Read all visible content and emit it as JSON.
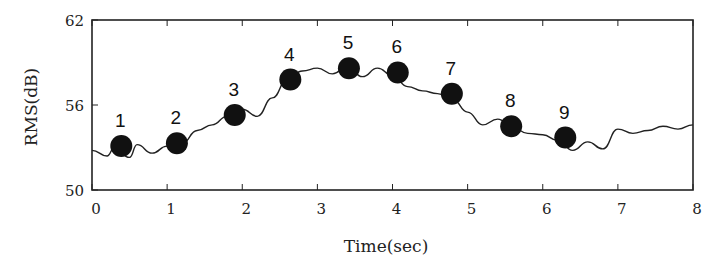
{
  "chart_data": {
    "type": "line",
    "title": "",
    "xlabel": "Time(sec)",
    "ylabel": "RMS(dB)",
    "xlim": [
      0,
      8
    ],
    "ylim": [
      50,
      62
    ],
    "x_ticks": [
      "0",
      "1",
      "2",
      "3",
      "4",
      "5",
      "6",
      "7",
      "8"
    ],
    "y_ticks": [
      "50",
      "56",
      "62"
    ],
    "grid": false,
    "legend": null,
    "series": [
      {
        "name": "RMS",
        "x": [
          0,
          0.2,
          0.3,
          0.5,
          0.6,
          0.8,
          1.0,
          1.2,
          1.4,
          1.6,
          1.8,
          2.0,
          2.2,
          2.4,
          2.6,
          2.8,
          3.0,
          3.2,
          3.4,
          3.6,
          3.8,
          4.0,
          4.2,
          4.4,
          4.6,
          4.8,
          5.0,
          5.2,
          5.4,
          5.6,
          5.8,
          6.0,
          6.2,
          6.4,
          6.6,
          6.8,
          7.0,
          7.2,
          7.4,
          7.6,
          7.8,
          8.0
        ],
        "values": [
          52.8,
          52.4,
          53.0,
          52.3,
          53.2,
          52.6,
          53.1,
          53.3,
          54.2,
          54.6,
          55.2,
          55.7,
          55.2,
          56.5,
          57.8,
          58.4,
          58.6,
          58.2,
          58.7,
          58.0,
          58.6,
          58.1,
          57.3,
          57.0,
          56.8,
          56.4,
          55.5,
          54.6,
          55.0,
          54.4,
          54.0,
          53.9,
          53.5,
          52.8,
          53.4,
          52.9,
          54.3,
          54.0,
          54.2,
          54.5,
          54.3,
          54.6
        ]
      }
    ],
    "markers": [
      {
        "label": "1",
        "x": 0.39,
        "y": 53.1
      },
      {
        "label": "2",
        "x": 1.13,
        "y": 53.3
      },
      {
        "label": "3",
        "x": 1.9,
        "y": 55.3
      },
      {
        "label": "4",
        "x": 2.64,
        "y": 57.8
      },
      {
        "label": "5",
        "x": 3.42,
        "y": 58.6
      },
      {
        "label": "6",
        "x": 4.07,
        "y": 58.3
      },
      {
        "label": "7",
        "x": 4.79,
        "y": 56.8
      },
      {
        "label": "8",
        "x": 5.58,
        "y": 54.5
      },
      {
        "label": "9",
        "x": 6.3,
        "y": 53.7
      }
    ]
  },
  "colors": {
    "line": "#222222",
    "marker": "#111111",
    "frame": "#222222"
  }
}
